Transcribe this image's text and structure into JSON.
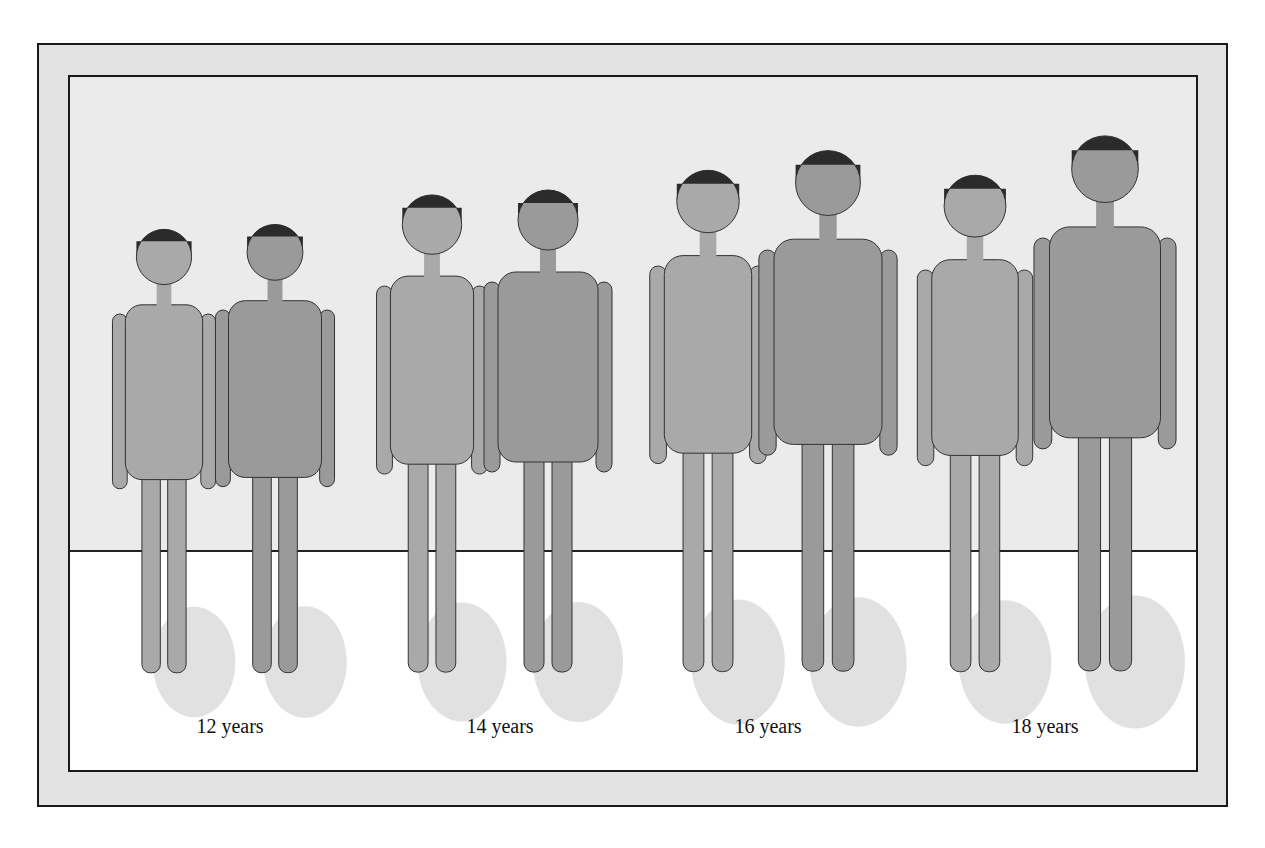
{
  "diagram": {
    "colors": {
      "outer_frame": "#e3e3e3",
      "wall": "#ebebeb",
      "floor": "#ffffff",
      "figure_female": "#a9a9a9",
      "figure_male": "#9a9a9a",
      "hair": "#2b2b2b",
      "shadow": "#c4c4c4"
    },
    "groups": [
      {
        "label": "12 years",
        "figures": [
          {
            "sex": "female",
            "height": 460,
            "cx": 94
          },
          {
            "sex": "male",
            "height": 465,
            "cx": 205
          }
        ]
      },
      {
        "label": "14 years",
        "figures": [
          {
            "sex": "female",
            "height": 495,
            "cx": 362
          },
          {
            "sex": "male",
            "height": 500,
            "cx": 478
          }
        ]
      },
      {
        "label": "16 years",
        "figures": [
          {
            "sex": "female",
            "height": 520,
            "cx": 638
          },
          {
            "sex": "male",
            "height": 540,
            "cx": 758
          }
        ]
      },
      {
        "label": "18 years",
        "figures": [
          {
            "sex": "female",
            "height": 515,
            "cx": 905
          },
          {
            "sex": "male",
            "height": 555,
            "cx": 1035
          }
        ]
      }
    ]
  }
}
